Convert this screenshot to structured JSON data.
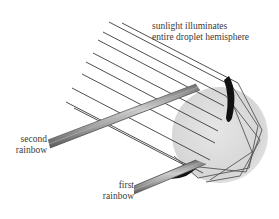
{
  "diagram": {
    "labels": {
      "sunlight_line1": "sunlight illuminates",
      "sunlight_line2": "entire droplet hemisphere",
      "second_line1": "second",
      "second_line2": "rainbow",
      "first_line1": "first",
      "first_line2": "rainbow"
    },
    "colors": {
      "background": "#ffffff",
      "droplet": "#d9d9d9",
      "ray": "#3a3a3a",
      "bundle": "#8c8c8c",
      "caustic": "#111111",
      "text": "#3a3a3a"
    },
    "elements": {
      "droplet": "spherical water droplet (grey disc)",
      "incoming_rays": "parallel sunlight rays",
      "second_bundle": "exiting rays forming second rainbow",
      "first_bundle": "exiting rays forming first rainbow"
    }
  }
}
